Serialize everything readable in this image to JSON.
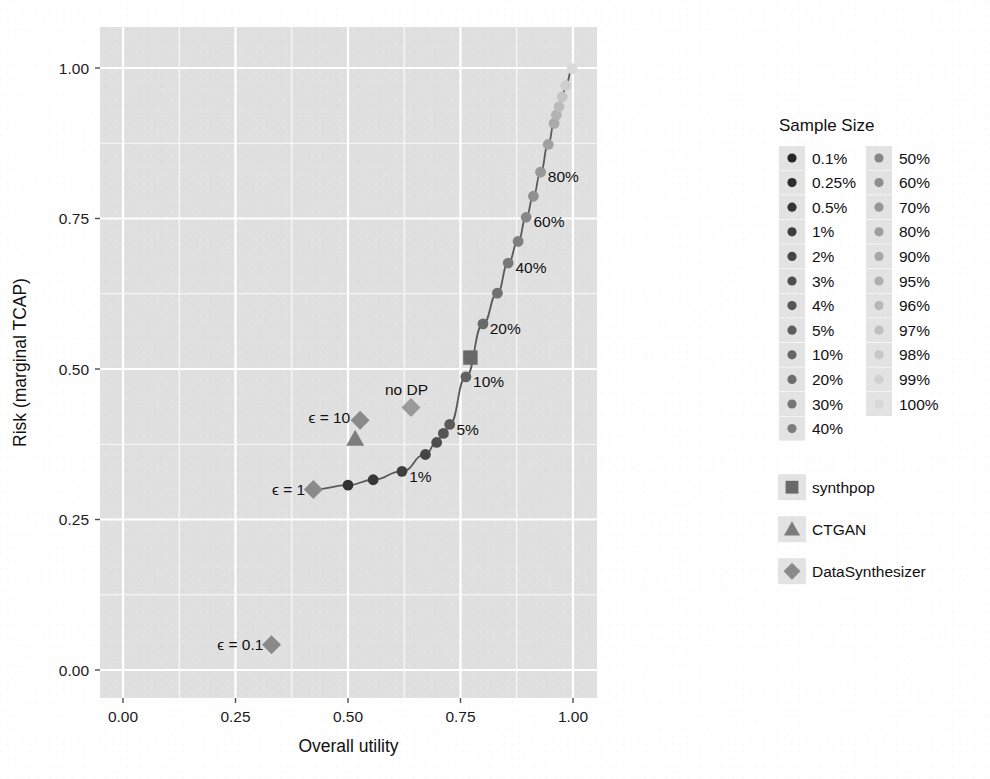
{
  "chart_data": {
    "type": "scatter",
    "title": "",
    "xlabel": "Overall utility",
    "ylabel": "Risk (marginal TCAP)",
    "xlim": [
      -0.03,
      1.06
    ],
    "ylim": [
      -0.055,
      1.06
    ],
    "xticks": [
      "0.00",
      "0.25",
      "0.50",
      "0.75",
      "1.00"
    ],
    "xtick_values": [
      0.0,
      0.25,
      0.5,
      0.75,
      1.0
    ],
    "yticks": [
      "0.00",
      "0.25",
      "0.50",
      "0.75",
      "1.00"
    ],
    "ytick_values": [
      0.0,
      0.25,
      0.5,
      0.75,
      1.0
    ],
    "grid": true,
    "panel_background": "#e0e0e0",
    "grid_color": "#ffffff",
    "legend_position": "right",
    "series": [
      {
        "name": "synthpop",
        "marker": "circle-line",
        "note": "sample-size sweep connected by line",
        "points": [
          {
            "label": "0.1%",
            "x": 0.424,
            "y": 0.3,
            "color": "#2b2b2b"
          },
          {
            "label": "0.25%",
            "x": 0.5,
            "y": 0.307,
            "color": "#313131"
          },
          {
            "label": "0.5%",
            "x": 0.556,
            "y": 0.316,
            "color": "#383838"
          },
          {
            "label": "1%",
            "x": 0.62,
            "y": 0.33,
            "color": "#3f3f3f"
          },
          {
            "label": "2%",
            "x": 0.672,
            "y": 0.358,
            "color": "#464646"
          },
          {
            "label": "3%",
            "x": 0.697,
            "y": 0.378,
            "color": "#4d4d4d"
          },
          {
            "label": "4%",
            "x": 0.712,
            "y": 0.393,
            "color": "#545454"
          },
          {
            "label": "5%",
            "x": 0.726,
            "y": 0.408,
            "color": "#5b5b5b"
          },
          {
            "label": "10%",
            "x": 0.762,
            "y": 0.487,
            "color": "#626262"
          },
          {
            "label": "20%",
            "x": 0.8,
            "y": 0.575,
            "color": "#6a6a6a"
          },
          {
            "label": "30%",
            "x": 0.832,
            "y": 0.626,
            "color": "#717171"
          },
          {
            "label": "40%",
            "x": 0.856,
            "y": 0.676,
            "color": "#787878"
          },
          {
            "label": "50%",
            "x": 0.878,
            "y": 0.712,
            "color": "#808080"
          },
          {
            "label": "60%",
            "x": 0.896,
            "y": 0.752,
            "color": "#888888"
          },
          {
            "label": "70%",
            "x": 0.912,
            "y": 0.787,
            "color": "#909090"
          },
          {
            "label": "80%",
            "x": 0.928,
            "y": 0.827,
            "color": "#989898"
          },
          {
            "label": "90%",
            "x": 0.945,
            "y": 0.873,
            "color": "#a1a1a1"
          },
          {
            "label": "95%",
            "x": 0.958,
            "y": 0.908,
            "color": "#aaaaaa"
          },
          {
            "label": "96%",
            "x": 0.963,
            "y": 0.922,
            "color": "#b3b3b3"
          },
          {
            "label": "97%",
            "x": 0.969,
            "y": 0.936,
            "color": "#bcbcbc"
          },
          {
            "label": "98%",
            "x": 0.976,
            "y": 0.952,
            "color": "#c5c5c5"
          },
          {
            "label": "99%",
            "x": 0.984,
            "y": 0.971,
            "color": "#cfcfcf"
          },
          {
            "label": "100%",
            "x": 0.998,
            "y": 0.999,
            "color": "#d9d9d9"
          }
        ]
      },
      {
        "name": "synthpop-marker",
        "marker": "square",
        "points": [
          {
            "label": "synthpop",
            "x": 0.772,
            "y": 0.519,
            "color": "#696969"
          }
        ]
      },
      {
        "name": "CTGAN",
        "marker": "triangle",
        "points": [
          {
            "label": "CTGAN",
            "x": 0.516,
            "y": 0.384,
            "color": "#7d7d7d"
          }
        ]
      },
      {
        "name": "DataSynthesizer",
        "marker": "diamond",
        "points": [
          {
            "label": "no DP",
            "x": 0.64,
            "y": 0.436,
            "color": "#9a9a9a"
          },
          {
            "label": "ϵ = 10",
            "x": 0.527,
            "y": 0.415,
            "color": "#8a8a8a"
          },
          {
            "label": "ϵ = 1",
            "x": 0.423,
            "y": 0.3,
            "color": "#8a8a8a"
          },
          {
            "label": "ϵ = 0.1",
            "x": 0.33,
            "y": 0.042,
            "color": "#8a8a8a"
          }
        ]
      }
    ],
    "curve_annotations": [
      {
        "text": "1%",
        "x": 0.636,
        "y": 0.322,
        "anchor": "start"
      },
      {
        "text": "5%",
        "x": 0.741,
        "y": 0.4,
        "anchor": "start"
      },
      {
        "text": "10%",
        "x": 0.778,
        "y": 0.48,
        "anchor": "start"
      },
      {
        "text": "20%",
        "x": 0.815,
        "y": 0.568,
        "anchor": "start"
      },
      {
        "text": "40%",
        "x": 0.872,
        "y": 0.669,
        "anchor": "start"
      },
      {
        "text": "60%",
        "x": 0.912,
        "y": 0.745,
        "anchor": "start"
      },
      {
        "text": "80%",
        "x": 0.944,
        "y": 0.82,
        "anchor": "start"
      }
    ],
    "model_annotations": [
      {
        "text": "no DP",
        "x": 0.63,
        "y": 0.466,
        "anchor": "middle"
      },
      {
        "text": "ϵ = 10",
        "x": 0.505,
        "y": 0.42,
        "anchor": "end"
      },
      {
        "text": "ϵ = 1",
        "x": 0.405,
        "y": 0.3,
        "anchor": "end"
      },
      {
        "text": "ϵ = 0.1",
        "x": 0.312,
        "y": 0.042,
        "anchor": "end"
      }
    ]
  },
  "legend": {
    "size_title": "Sample Size",
    "size_column_1": [
      {
        "label": "0.1%",
        "color": "#262626"
      },
      {
        "label": "0.25%",
        "color": "#2e2e2e"
      },
      {
        "label": "0.5%",
        "color": "#363636"
      },
      {
        "label": "1%",
        "color": "#3e3e3e"
      },
      {
        "label": "2%",
        "color": "#464646"
      },
      {
        "label": "3%",
        "color": "#4e4e4e"
      },
      {
        "label": "4%",
        "color": "#565656"
      },
      {
        "label": "5%",
        "color": "#5e5e5e"
      },
      {
        "label": "10%",
        "color": "#666666"
      },
      {
        "label": "20%",
        "color": "#6e6e6e"
      },
      {
        "label": "30%",
        "color": "#767676"
      },
      {
        "label": "40%",
        "color": "#7e7e7e"
      }
    ],
    "size_column_2": [
      {
        "label": "50%",
        "color": "#878787"
      },
      {
        "label": "60%",
        "color": "#8f8f8f"
      },
      {
        "label": "70%",
        "color": "#979797"
      },
      {
        "label": "80%",
        "color": "#9f9f9f"
      },
      {
        "label": "90%",
        "color": "#a8a8a8"
      },
      {
        "label": "95%",
        "color": "#b0b0b0"
      },
      {
        "label": "96%",
        "color": "#b8b8b8"
      },
      {
        "label": "97%",
        "color": "#c0c0c0"
      },
      {
        "label": "98%",
        "color": "#c8c8c8"
      },
      {
        "label": "99%",
        "color": "#d0d0d0"
      },
      {
        "label": "100%",
        "color": "#d8d8d8"
      }
    ],
    "shape_items": [
      {
        "label": "synthpop",
        "marker": "square",
        "color": "#696969"
      },
      {
        "label": "CTGAN",
        "marker": "triangle",
        "color": "#7d7d7d"
      },
      {
        "label": "DataSynthesizer",
        "marker": "diamond",
        "color": "#8a8a8a"
      }
    ]
  }
}
